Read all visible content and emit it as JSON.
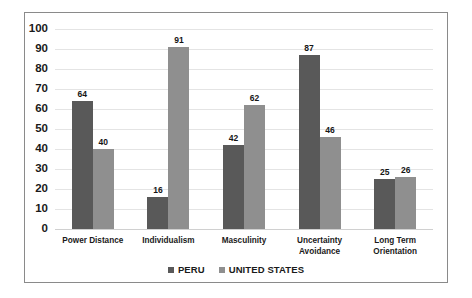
{
  "chart_data": {
    "type": "bar",
    "title": "",
    "subtitle": "",
    "xlabel": "",
    "ylabel": "",
    "ylim": [
      0,
      100
    ],
    "yticks": [
      100,
      90,
      80,
      70,
      60,
      50,
      40,
      30,
      20,
      10,
      0
    ],
    "grid": true,
    "legend_position": "bottom",
    "categories": [
      "Power Distance",
      "Individualism",
      "Masculinity",
      "Uncertainty Avoidance",
      "Long Term Orientation"
    ],
    "series": [
      {
        "name": "PERU",
        "color": "#595959",
        "values": [
          64,
          16,
          42,
          87,
          25
        ]
      },
      {
        "name": "UNITED STATES",
        "color": "#8f8f8f",
        "values": [
          40,
          91,
          62,
          46,
          26
        ]
      }
    ]
  },
  "colors": {
    "series_peru": "#595959",
    "series_united_states": "#8f8f8f",
    "gridline": "#e4e4e4",
    "frame_border": "#8a8a8a",
    "text": "#1a1a1a",
    "background": "#ffffff"
  }
}
